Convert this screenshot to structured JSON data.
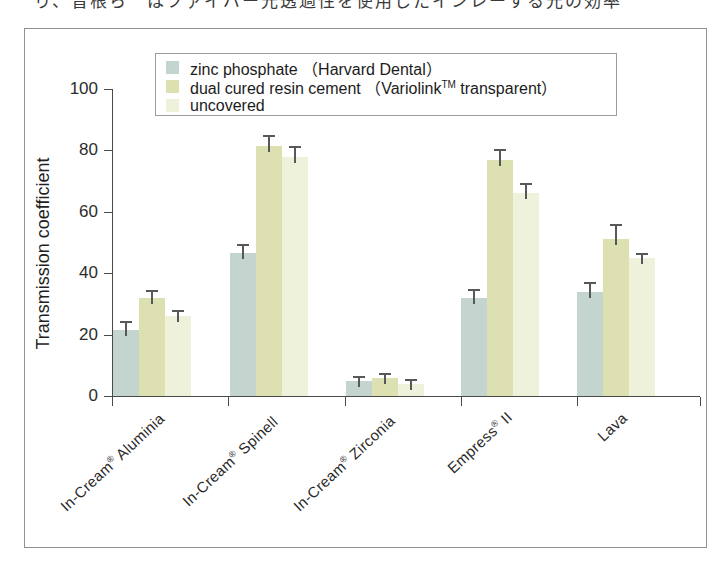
{
  "page": {
    "top_caption": "り、曾根ら　はファイバー光透過性を使用したインレーする光の効率"
  },
  "legend": {
    "items": [
      {
        "label": "zinc phosphate",
        "paren": "（Harvard Dental）",
        "color": "#c4d5cf",
        "name": "zinc-phosphate"
      },
      {
        "label": "dual cured resin cement",
        "paren": "（Variolink",
        "sup": "TM",
        "paren_tail": " transparent）",
        "color": "#dde0b0",
        "name": "dual-cured-resin-cement"
      },
      {
        "label": "uncovered",
        "paren": "",
        "color": "#eef2da",
        "name": "uncovered"
      }
    ]
  },
  "chart_data": {
    "type": "bar",
    "title": "",
    "xlabel": "",
    "ylabel": "Transmission coefficient",
    "ylim": [
      0,
      100
    ],
    "yticks": [
      0,
      20,
      40,
      60,
      80,
      100
    ],
    "grid": false,
    "legend_position": "top-center",
    "categories": [
      "In-Cream® Aluminia",
      "In-Cream® Spinell",
      "In-Cream® Zirconia",
      "Empress® II",
      "Lava"
    ],
    "categories_parts": [
      {
        "main": "In-Cream",
        "mark": "®",
        "tail": " Aluminia"
      },
      {
        "main": "In-Cream",
        "mark": "®",
        "tail": " Spinell"
      },
      {
        "main": "In-Cream",
        "mark": "®",
        "tail": " Zirconia"
      },
      {
        "main": "Empress",
        "mark": "®",
        "tail": " II"
      },
      {
        "main": "Lava",
        "mark": "",
        "tail": ""
      }
    ],
    "series": [
      {
        "name": "zinc phosphate (Harvard Dental)",
        "color": "#c4d5cf",
        "values": [
          21.5,
          46.5,
          5.0,
          32.0,
          34.0
        ],
        "errors": [
          3.0,
          3.0,
          1.5,
          3.0,
          3.0
        ]
      },
      {
        "name": "dual cured resin cement (Variolink TM transparent)",
        "color": "#dde0b0",
        "values": [
          32.0,
          81.5,
          6.0,
          77.0,
          51.0
        ],
        "errors": [
          2.5,
          3.5,
          1.5,
          3.5,
          5.0
        ]
      },
      {
        "name": "uncovered",
        "color": "#eef2da",
        "values": [
          26.0,
          78.0,
          4.0,
          66.0,
          45.0
        ],
        "errors": [
          2.0,
          3.5,
          1.5,
          3.5,
          1.5
        ]
      }
    ]
  }
}
